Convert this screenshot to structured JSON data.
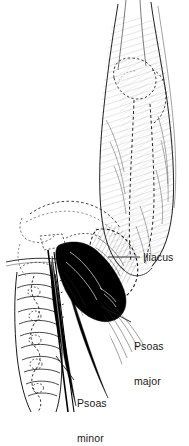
{
  "figure": {
    "name": "iliopsoas-muscle-anatomy-illustration",
    "background_color": "#ffffff",
    "ink_color": "#1a1a1a",
    "fill_color": "#000000",
    "width": 189,
    "height": 420,
    "style": "pen-and-ink line drawing with hatching, dashed bone outlines and solid black muscle"
  },
  "labels": [
    {
      "id": "iliacus",
      "text": "Iliacus",
      "x": 143,
      "y": 252
    },
    {
      "id": "psoas-major",
      "text": "Psoas\nmajor",
      "x": 134,
      "y": 318
    },
    {
      "id": "psoas-minor",
      "text": "Psoas\nminor",
      "x": 77,
      "y": 375
    }
  ],
  "label_text": {
    "iliacus": "Iliacus",
    "psoas_major_line1": "Psoas",
    "psoas_major_line2": "major",
    "psoas_minor_line1": "Psoas",
    "psoas_minor_line2": "minor"
  },
  "structures": [
    {
      "id": "femur-thigh",
      "name": "thigh / femur shaft with hatched musculature",
      "rendering": "outline with fine parallel hatching"
    },
    {
      "id": "hip-joint",
      "name": "hip joint / femoral head region",
      "rendering": "dashed bone outline"
    },
    {
      "id": "iliac-crest",
      "name": "iliac crest and ilium",
      "rendering": "dashed bone outline"
    },
    {
      "id": "lumbar-spine",
      "name": "lumbar vertebral column and sacrum",
      "rendering": "stacked segments with dashed contours"
    },
    {
      "id": "psoas-major-muscle",
      "name": "psoas major muscle belly",
      "rendering": "solid black mass"
    },
    {
      "id": "psoas-minor-muscle",
      "name": "psoas minor muscle and tendon",
      "rendering": "narrow solid black strip"
    },
    {
      "id": "iliacus-muscle",
      "name": "iliacus muscle",
      "rendering": "fan of fine hatch lines in iliac fossa"
    }
  ],
  "leader_lines": [
    {
      "id": "leader-iliacus",
      "from": [
        140,
        257
      ],
      "to": [
        108,
        257
      ]
    },
    {
      "id": "leader-psoas-major",
      "from": [
        131,
        322
      ],
      "to": [
        100,
        306
      ]
    },
    {
      "id": "leader-psoas-minor",
      "from": [
        74,
        380
      ],
      "to": [
        56,
        358
      ]
    }
  ]
}
